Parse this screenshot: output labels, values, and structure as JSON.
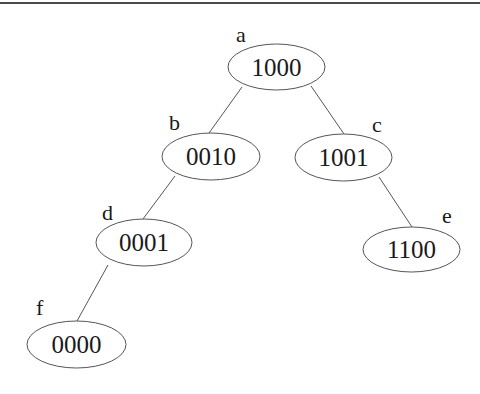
{
  "diagram": {
    "type": "binary-tree",
    "nodes": [
      {
        "id": "a",
        "label": "a",
        "value": "1000",
        "cx": 276.5,
        "cy": 67,
        "rx": 48.5,
        "ry": 23,
        "lx": 236,
        "ly": 42
      },
      {
        "id": "b",
        "label": "b",
        "value": "0010",
        "cx": 211,
        "cy": 156.5,
        "rx": 49,
        "ry": 23.5,
        "lx": 169,
        "ly": 130
      },
      {
        "id": "c",
        "label": "c",
        "value": "1001",
        "cx": 343.5,
        "cy": 157.5,
        "rx": 48.5,
        "ry": 23.5,
        "lx": 372,
        "ly": 132
      },
      {
        "id": "d",
        "label": "d",
        "value": "0001",
        "cx": 144,
        "cy": 242.5,
        "rx": 48,
        "ry": 23.5,
        "lx": 102,
        "ly": 220
      },
      {
        "id": "e",
        "label": "e",
        "value": "1100",
        "cx": 411.5,
        "cy": 249.5,
        "rx": 48.5,
        "ry": 22.5,
        "lx": 442,
        "ly": 223
      },
      {
        "id": "f",
        "label": "f",
        "value": "0000",
        "cx": 76.5,
        "cy": 344.5,
        "rx": 49.5,
        "ry": 23.5,
        "lx": 36,
        "ly": 315
      }
    ],
    "edges": [
      {
        "from": "a",
        "to": "b",
        "x1": 242,
        "y1": 87,
        "x2": 209,
        "y2": 133
      },
      {
        "from": "a",
        "to": "c",
        "x1": 311,
        "y1": 86,
        "x2": 344,
        "y2": 134
      },
      {
        "from": "b",
        "to": "d",
        "x1": 175,
        "y1": 176,
        "x2": 143,
        "y2": 219
      },
      {
        "from": "c",
        "to": "e",
        "x1": 379,
        "y1": 177,
        "x2": 412,
        "y2": 227
      },
      {
        "from": "d",
        "to": "f",
        "x1": 108,
        "y1": 265,
        "x2": 77,
        "y2": 321
      }
    ]
  }
}
